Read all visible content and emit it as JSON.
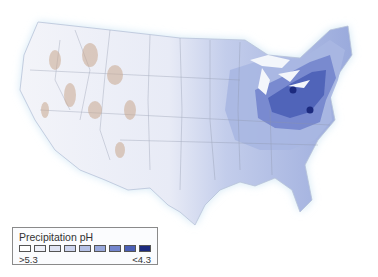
{
  "map": {
    "subject": "Contiguous United States",
    "variable": "Precipitation pH",
    "hotspots": [
      {
        "label": "",
        "x": 293,
        "y": 90
      },
      {
        "label": "",
        "x": 310,
        "y": 110
      }
    ]
  },
  "legend": {
    "title": "Precipitation pH",
    "low_label": ">5.3",
    "high_label": "<4.3",
    "swatches": [
      "#ffffff",
      "#eef0f8",
      "#dfe3f2",
      "#ccd4ee",
      "#b5c1e6",
      "#98a8dc",
      "#7385cd",
      "#4b5fb6",
      "#1c2a7e"
    ]
  }
}
